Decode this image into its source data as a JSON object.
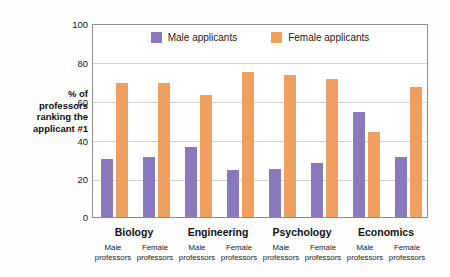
{
  "chart_data": {
    "type": "bar",
    "title": "",
    "subtitle": "",
    "xlabel": "",
    "ylabel": "% of\nprofessors\nranking the\napplicant #1",
    "ylim": [
      0,
      100
    ],
    "yticks": [
      0,
      20,
      40,
      60,
      80,
      100
    ],
    "ytick_labels": [
      "0",
      "20",
      "40",
      "60",
      "80",
      "100"
    ],
    "grid": true,
    "legend_position": "top-center",
    "categories": [
      "Biology / Male professors",
      "Biology / Female professors",
      "Engineering / Male professors",
      "Engineering / Female professors",
      "Psychology / Male professors",
      "Psychology / Female professors",
      "Economics / Male professors",
      "Economics / Female professors"
    ],
    "groups": [
      {
        "name": "Biology",
        "subgroups": [
          {
            "label": "Male\nprofessors",
            "male_applicants": 30,
            "female_applicants": 69
          },
          {
            "label": "Female\nprofessors",
            "male_applicants": 31,
            "female_applicants": 69
          }
        ]
      },
      {
        "name": "Engineering",
        "subgroups": [
          {
            "label": "Male\nprofessors",
            "male_applicants": 36,
            "female_applicants": 63
          },
          {
            "label": "Female\nprofessors",
            "male_applicants": 24,
            "female_applicants": 75
          }
        ]
      },
      {
        "name": "Psychology",
        "subgroups": [
          {
            "label": "Male\nprofessors",
            "male_applicants": 25,
            "female_applicants": 73
          },
          {
            "label": "Female\nprofessors",
            "male_applicants": 28,
            "female_applicants": 71
          }
        ]
      },
      {
        "name": "Economics",
        "subgroups": [
          {
            "label": "Male\nprofessors",
            "male_applicants": 54,
            "female_applicants": 44
          },
          {
            "label": "Female\nprofessors",
            "male_applicants": 31,
            "female_applicants": 67
          }
        ]
      }
    ],
    "series": [
      {
        "name": "Male applicants",
        "color": "#8a78bd",
        "values": [
          30,
          31,
          36,
          24,
          25,
          28,
          54,
          31
        ]
      },
      {
        "name": "Female applicants",
        "color": "#ef9f5f",
        "values": [
          69,
          69,
          63,
          75,
          73,
          71,
          44,
          67
        ]
      }
    ]
  },
  "legend": {
    "items": [
      {
        "label": "Male applicants",
        "color": "#8a78bd"
      },
      {
        "label": "Female applicants",
        "color": "#ef9f5f"
      }
    ]
  },
  "axis": {
    "y_title": "% of\nprofessors\nranking the\napplicant #1",
    "y_tick_100": "100",
    "y_tick_80": "80",
    "y_tick_60": "60",
    "y_tick_40": "40",
    "y_tick_20": "20",
    "y_tick_0": "0"
  },
  "x_axis": {
    "groups": [
      "Biology",
      "Engineering",
      "Psychology",
      "Economics"
    ],
    "sub_labels": [
      "Male\nprofessors",
      "Female\nprofessors",
      "Male\nprofessors",
      "Female\nprofessors",
      "Male\nprofessors",
      "Female\nprofessors",
      "Male\nprofessors",
      "Female\nprofessors"
    ]
  },
  "colors": {
    "male": "#8a78bd",
    "female": "#ef9f5f",
    "grid": "#d3d3d3",
    "frame": "#8d8d8d",
    "background": "#fdfdfd"
  }
}
